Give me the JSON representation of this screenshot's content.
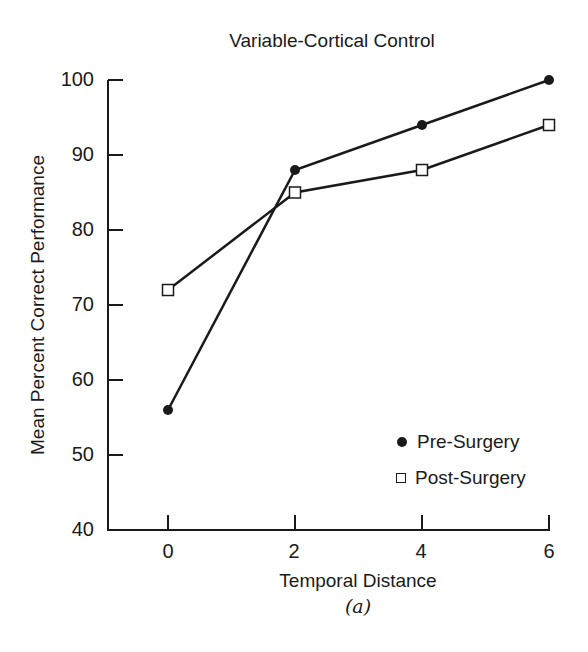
{
  "chart_data": {
    "type": "line",
    "title": "Variable-Cortical Control",
    "xlabel": "Temporal Distance",
    "sublabel": "(a)",
    "ylabel": "Mean Percent Correct Performance",
    "x": [
      0,
      2,
      4,
      6
    ],
    "xticks": [
      "0",
      "2",
      "4",
      "6"
    ],
    "yticks": [
      "40",
      "50",
      "60",
      "70",
      "80",
      "90",
      "100"
    ],
    "ylim": [
      40,
      100
    ],
    "xlim": [
      -1,
      6
    ],
    "grid": false,
    "legend_position": "lower right",
    "series": [
      {
        "name": "Pre-Surgery",
        "marker": "filled-circle",
        "values": [
          56,
          88,
          94,
          100
        ]
      },
      {
        "name": "Post-Surgery",
        "marker": "open-square",
        "values": [
          72,
          85,
          88,
          94
        ]
      }
    ]
  },
  "legend": {
    "items": [
      {
        "label": "Pre-Surgery"
      },
      {
        "label": "Post-Surgery"
      }
    ]
  }
}
